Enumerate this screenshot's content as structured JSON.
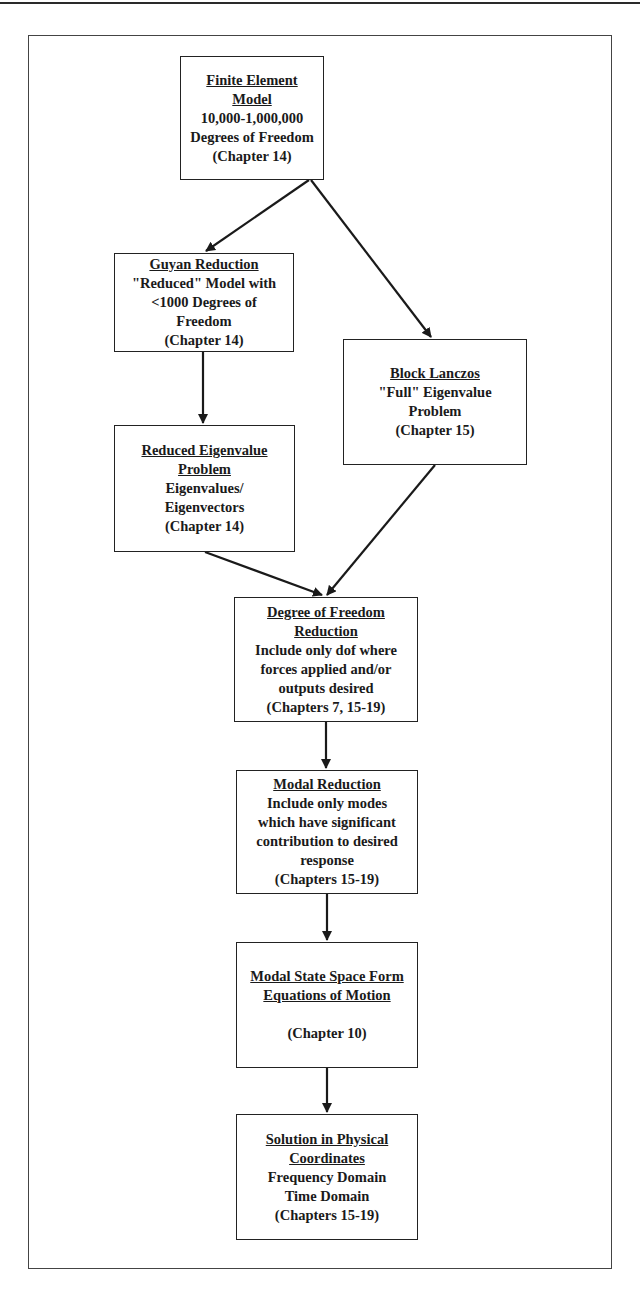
{
  "diagram": {
    "type": "flowchart",
    "nodes": [
      {
        "id": "fem",
        "title": [
          "Finite Element Model"
        ],
        "body": [
          "10,000-1,000,000",
          "Degrees of Freedom",
          "(Chapter 14)"
        ]
      },
      {
        "id": "guyan",
        "title": [
          "Guyan Reduction"
        ],
        "body": [
          "\"Reduced\" Model with",
          "<1000 Degrees of",
          "Freedom",
          "(Chapter 14)"
        ]
      },
      {
        "id": "lanczos",
        "title": [
          "Block Lanczos"
        ],
        "body": [
          "\"Full\" Eigenvalue",
          "Problem",
          "(Chapter 15)"
        ]
      },
      {
        "id": "reduced_eig",
        "title": [
          "Reduced Eigenvalue",
          "Problem"
        ],
        "body": [
          "Eigenvalues/",
          "Eigenvectors",
          "(Chapter 14)"
        ]
      },
      {
        "id": "dof_reduction",
        "title": [
          "Degree of Freedom",
          "Reduction"
        ],
        "body": [
          "Include only dof where",
          "forces applied and/or",
          "outputs desired",
          "(Chapters 7, 15-19)"
        ]
      },
      {
        "id": "modal_reduction",
        "title": [
          "Modal Reduction"
        ],
        "body": [
          "Include only modes",
          "which have significant",
          "contribution to desired",
          "response",
          "(Chapters 15-19)"
        ]
      },
      {
        "id": "state_space",
        "title": [
          "Modal State Space Form",
          "Equations of Motion"
        ],
        "body": [
          "",
          "(Chapter 10)"
        ]
      },
      {
        "id": "solution",
        "title": [
          "Solution in Physical",
          "Coordinates"
        ],
        "body": [
          "Frequency Domain",
          "Time Domain",
          "(Chapters 15-19)"
        ]
      }
    ],
    "edges": [
      {
        "from": "fem",
        "to": "guyan"
      },
      {
        "from": "fem",
        "to": "lanczos"
      },
      {
        "from": "guyan",
        "to": "reduced_eig"
      },
      {
        "from": "reduced_eig",
        "to": "dof_reduction"
      },
      {
        "from": "lanczos",
        "to": "dof_reduction"
      },
      {
        "from": "dof_reduction",
        "to": "modal_reduction"
      },
      {
        "from": "modal_reduction",
        "to": "state_space"
      },
      {
        "from": "state_space",
        "to": "solution"
      }
    ]
  }
}
